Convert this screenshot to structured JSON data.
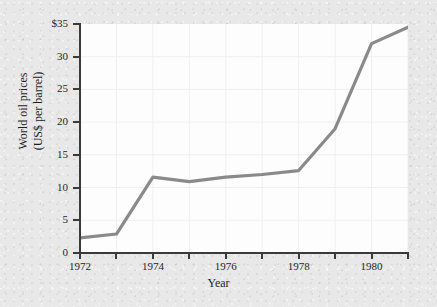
{
  "chart_data": {
    "type": "line",
    "title": "",
    "xlabel": "Year",
    "ylabel": "World oil prices\n(US$ per barrel)",
    "ylabel_line1": "World oil prices",
    "ylabel_line2": "(US$ per barrel)",
    "x": [
      1972,
      1973,
      1974,
      1975,
      1976,
      1977,
      1978,
      1979,
      1980,
      1981
    ],
    "values": [
      2.3,
      2.9,
      11.6,
      10.9,
      11.6,
      12.0,
      12.6,
      19.0,
      32.0,
      34.5
    ],
    "series": [
      {
        "name": "World oil prices",
        "values": [
          2.3,
          2.9,
          11.6,
          10.9,
          11.6,
          12.0,
          12.6,
          19.0,
          32.0,
          34.5
        ]
      }
    ],
    "xlim": [
      1972,
      1981
    ],
    "ylim": [
      0,
      35
    ],
    "ytick_values": [
      0,
      5,
      10,
      15,
      20,
      25,
      30,
      35
    ],
    "ytick_labels": [
      "0",
      "5",
      "10",
      "15",
      "20",
      "25",
      "30",
      "$35"
    ],
    "xtick_values": [
      1972,
      1973,
      1974,
      1975,
      1976,
      1977,
      1978,
      1979,
      1980,
      1981
    ],
    "xtick_labels": [
      "1972",
      "",
      "1974",
      "",
      "1976",
      "",
      "1978",
      "",
      "1980",
      ""
    ],
    "grid": true,
    "legend": false,
    "legend_position": "none",
    "line_color": "#8a8a8a",
    "grid_color": "#efefef",
    "plot_background": "#fdfdfd",
    "figure_background": "#e8e8e8",
    "axis_color": "#3a3a3a"
  }
}
